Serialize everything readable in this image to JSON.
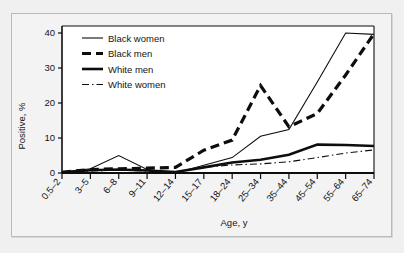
{
  "figure": {
    "background_color": "#f0f0f0",
    "panel_color": "#f3f3f3",
    "plot_color": "#ffffff",
    "border_color": "#b9b9b9",
    "ink_color": "#0d0d0d"
  },
  "chart_data": {
    "type": "line",
    "title": "",
    "subtitle": "",
    "xlabel": "Age, y",
    "ylabel": "Positive, %",
    "categories": [
      "0.5–2",
      "3–5",
      "6–8",
      "9–11",
      "12–14",
      "15–17",
      "18–24",
      "25–34",
      "35–44",
      "45–54",
      "55–64",
      "65–74"
    ],
    "xtick_labels": [
      "0.5–2",
      "3–5",
      "6–8",
      "9–11",
      "12–14",
      "15–17",
      "18–24",
      "25–34",
      "35–44",
      "55–64",
      "65–74"
    ],
    "ytick_labels": [
      "0",
      "10",
      "20",
      "30",
      "40"
    ],
    "ytick_values": [
      0,
      10,
      20,
      30,
      40
    ],
    "ylim": [
      0,
      42
    ],
    "xlim": [
      0,
      10
    ],
    "grid": false,
    "legend_position": "top-left",
    "series": [
      {
        "name": "Black women",
        "style": "solid-thin",
        "stroke_width": 1.1,
        "dasharray": "none",
        "values": [
          0.2,
          1.2,
          5.0,
          1.0,
          0.0,
          2.2,
          4.4,
          10.5,
          12.4,
          26.0,
          40.0,
          39.6
        ]
      },
      {
        "name": "Black men",
        "style": "dashed-thick",
        "stroke_width": 3.2,
        "dasharray": "9,5",
        "values": [
          0.2,
          1.0,
          1.2,
          1.4,
          1.6,
          6.5,
          9.4,
          25.0,
          13.2,
          17.0,
          28.0,
          39.8
        ]
      },
      {
        "name": "White men",
        "style": "solid-thick",
        "stroke_width": 2.6,
        "dasharray": "none",
        "values": [
          0.2,
          0.8,
          1.0,
          0.7,
          0.3,
          1.6,
          3.0,
          3.8,
          5.2,
          8.1,
          8.0,
          7.7
        ]
      },
      {
        "name": "White women",
        "style": "dashdot-thin",
        "stroke_width": 1.1,
        "dasharray": "7,3,1.5,3",
        "values": [
          0.2,
          0.6,
          0.8,
          0.6,
          0.3,
          1.6,
          2.3,
          2.6,
          3.2,
          4.4,
          5.7,
          6.6
        ]
      }
    ]
  },
  "legend": {
    "entries": [
      {
        "label": "Black women",
        "key": "black-women"
      },
      {
        "label": "Black men",
        "key": "black-men"
      },
      {
        "label": "White men",
        "key": "white-men"
      },
      {
        "label": "White women",
        "key": "white-women"
      }
    ]
  }
}
